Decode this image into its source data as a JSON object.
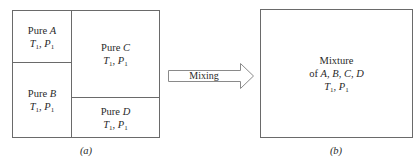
{
  "diagram": {
    "panel_a": {
      "caption": "(a)",
      "cells": [
        {
          "id": "A",
          "prefix": "Pure ",
          "species": "A",
          "T": "T",
          "T_sub": "1",
          "sep": ", ",
          "P": "P",
          "P_sub": "1"
        },
        {
          "id": "B",
          "prefix": "Pure ",
          "species": "B",
          "T": "T",
          "T_sub": "1",
          "sep": ", ",
          "P": "P",
          "P_sub": "1"
        },
        {
          "id": "C",
          "prefix": "Pure ",
          "species": "C",
          "T": "T",
          "T_sub": "1",
          "sep": ", ",
          "P": "P",
          "P_sub": "1"
        },
        {
          "id": "D",
          "prefix": "Pure ",
          "species": "D",
          "T": "T",
          "T_sub": "1",
          "sep": ", ",
          "P": "P",
          "P_sub": "1"
        }
      ]
    },
    "arrow": {
      "label": "Mixing"
    },
    "panel_b": {
      "caption": "(b)",
      "line1": "Mixture",
      "line2_prefix": "of ",
      "line2_species": "A, B, C, D",
      "T": "T",
      "T_sub": "1",
      "sep": ", ",
      "P": "P",
      "P_sub": "1"
    },
    "colors": {
      "stroke": "#6a6a6a",
      "text": "#2a2a2a",
      "background": "#ffffff"
    }
  }
}
